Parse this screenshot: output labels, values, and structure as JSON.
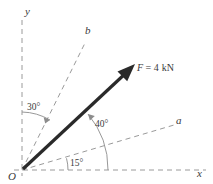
{
  "figure": {
    "type": "vector-force-diagram",
    "background_color": "#ffffff",
    "axes": {
      "y_label": "y",
      "x_label": "x",
      "origin_label": "O"
    },
    "reference_lines": [
      {
        "id": "b",
        "label": "b",
        "angle_from_x_deg": 60,
        "style": "dashed"
      },
      {
        "id": "a",
        "label": "a",
        "angle_from_x_deg": 15,
        "style": "dashed"
      }
    ],
    "force": {
      "label": "F = 4 kN",
      "symbol": "F",
      "equals": " = ",
      "magnitude": "4",
      "unit": "kN",
      "angle_from_x_deg": 40,
      "color": "#2a2a2a"
    },
    "angles": [
      {
        "id": "angle-30",
        "label": "30°",
        "value": 30,
        "from": "y",
        "to": "b"
      },
      {
        "id": "angle-40",
        "label": "40°",
        "value": 40,
        "from": "x",
        "to": "F"
      },
      {
        "id": "angle-15",
        "label": "15°",
        "value": 15,
        "from": "x",
        "to": "a"
      }
    ],
    "colors": {
      "dashed_line": "#9a9a9a",
      "arc": "#8c8c8c",
      "text": "#3a3a3a",
      "force": "#2a2a2a"
    }
  }
}
